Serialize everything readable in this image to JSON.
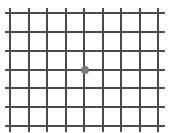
{
  "diagram": {
    "type": "amsler-grid",
    "colors": {
      "background": "#ffffff",
      "line": "#4a4a4a",
      "center_dot": "#7a7a7a"
    },
    "vertical_lines_x": [
      10,
      29,
      47,
      66,
      84,
      103,
      121,
      140,
      158
    ],
    "horizontal_lines_y": [
      13,
      32,
      51,
      70,
      88,
      107,
      126
    ],
    "vertical_extent": [
      8,
      132
    ],
    "horizontal_extent": [
      5,
      165
    ],
    "center_dot": {
      "cx": 84.5,
      "cy": 70,
      "r": 4
    }
  }
}
